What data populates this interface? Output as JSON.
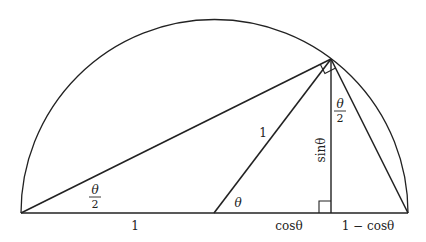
{
  "diagram": {
    "colors": {
      "stroke": "#222222",
      "background": "#ffffff"
    },
    "points": {
      "left": [
        21,
        213
      ],
      "center": [
        214,
        213
      ],
      "right": [
        408,
        213
      ],
      "top": [
        331,
        59
      ],
      "foot": [
        331,
        213
      ]
    },
    "labels": {
      "half_angle_left_num": "θ",
      "half_angle_left_den": "2",
      "base_left": "1",
      "radius": "1",
      "theta": "θ",
      "cos": "cosθ",
      "one_minus_cos": "1 − cosθ",
      "sin": "sinθ",
      "half_angle_top_num": "θ",
      "half_angle_top_den": "2"
    }
  }
}
